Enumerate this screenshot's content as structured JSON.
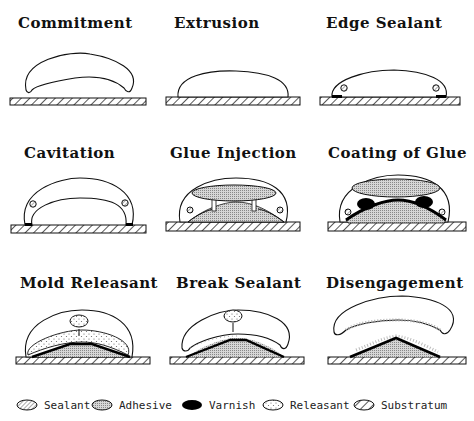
{
  "figure": {
    "type": "process-diagram",
    "panels": [
      {
        "id": 1,
        "title": "Commitment"
      },
      {
        "id": 2,
        "title": "Extrusion"
      },
      {
        "id": 3,
        "title": "Edge Sealant"
      },
      {
        "id": 4,
        "title": "Cavitation"
      },
      {
        "id": 5,
        "title": "Glue Injection"
      },
      {
        "id": 6,
        "title": "Coating of Glue"
      },
      {
        "id": 7,
        "title": "Mold Releasant"
      },
      {
        "id": 8,
        "title": "Break Sealant"
      },
      {
        "id": 9,
        "title": "Disengagement"
      }
    ],
    "legend": [
      {
        "key": "sealant",
        "label": "Sealant",
        "pattern": "fine-diagonal-hatch"
      },
      {
        "key": "adhesive",
        "label": "Adhesive",
        "pattern": "dense-dots-gray"
      },
      {
        "key": "varnish",
        "label": "Varnish",
        "pattern": "solid-black"
      },
      {
        "key": "releasant",
        "label": "Releasant",
        "pattern": "sparse-dots"
      },
      {
        "key": "substratum",
        "label": "Substratum",
        "pattern": "coarse-diagonal-hatch"
      }
    ]
  },
  "colors": {
    "line": "#111111",
    "background": "#ffffff",
    "adhesive": "#bdbdbd",
    "varnish": "#000000"
  }
}
